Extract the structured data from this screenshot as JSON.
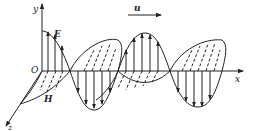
{
  "diagram": {
    "labels": {
      "y_axis": "y",
      "x_axis": "x",
      "z_axis": "z",
      "origin": "O",
      "electric_field": "E",
      "magnetic_field": "H",
      "velocity": "u"
    },
    "colors": {
      "stroke": "#222222",
      "background": "#ffffff"
    }
  }
}
